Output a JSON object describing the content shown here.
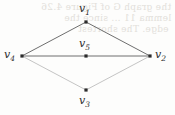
{
  "figure": {
    "kind": "undirected-graph-diagram",
    "background_color": "#fdfdfc",
    "edge_color_strong": "#6e6e6e",
    "edge_color_faint": "#b9b9b9",
    "vertex_color": "#2b2b2b",
    "label_color": "#2c2c2c"
  },
  "graph_data": {
    "type": "graph",
    "directed": false,
    "vertices": [
      {
        "id": "v1",
        "label": "v",
        "subscript": "1",
        "x": 86,
        "y": 22,
        "label_position": "above"
      },
      {
        "id": "v2",
        "label": "v",
        "subscript": "2",
        "x": 150,
        "y": 56,
        "label_position": "right"
      },
      {
        "id": "v3",
        "label": "v",
        "subscript": "3",
        "x": 86,
        "y": 90,
        "label_position": "below"
      },
      {
        "id": "v4",
        "label": "v",
        "subscript": "4",
        "x": 22,
        "y": 56,
        "label_position": "left"
      },
      {
        "id": "v5",
        "label": "v",
        "subscript": "5",
        "x": 86,
        "y": 56,
        "label_position": "above"
      }
    ],
    "edges": [
      {
        "from": "v4",
        "to": "v1",
        "weight_visual": "strong"
      },
      {
        "from": "v1",
        "to": "v2",
        "weight_visual": "strong"
      },
      {
        "from": "v4",
        "to": "v2",
        "weight_visual": "strong",
        "passes_through": "v5"
      },
      {
        "from": "v4",
        "to": "v3",
        "weight_visual": "faint"
      },
      {
        "from": "v3",
        "to": "v2",
        "weight_visual": "faint"
      }
    ],
    "vertex_count": 5,
    "edge_count": 5
  },
  "labels": {
    "v1": "v₁",
    "v2": "v₂",
    "v3": "v₃",
    "v4": "v₄",
    "v5": "v₅"
  },
  "ghost_text": {
    "line_a": "the graph G of Figure 4.26",
    "line_b": "lemma 11 ... since the",
    "line_c": "edge. The shortest",
    "line_d": "",
    "line_e": "",
    "line_f": ""
  }
}
